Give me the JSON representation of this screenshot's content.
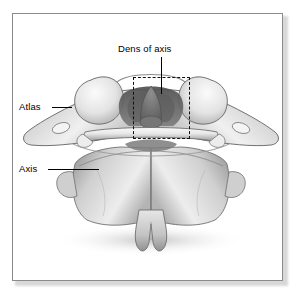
{
  "figure": {
    "view": "posterior-superior view of articulated C1 and C2",
    "style": "grayscale medical illustration",
    "frame": {
      "border_color": "#8b8b8b",
      "background": "#ffffff"
    }
  },
  "labels": [
    {
      "id": "dens",
      "text": "Dens of axis",
      "position": "top-center",
      "leader": "vertical line down to the dens tip"
    },
    {
      "id": "atlas",
      "text": "Atlas",
      "position": "left-upper",
      "leader": "short horizontal line to left transverse process"
    },
    {
      "id": "axis",
      "text": "Axis",
      "position": "left-lower",
      "leader": "long horizontal line to body of axis"
    }
  ],
  "annotations": [
    {
      "id": "highlight-box",
      "shape": "dashed-rectangle",
      "color": "#111111",
      "encloses": "dens of axis and anterior arch of atlas"
    }
  ],
  "palette": {
    "bone_light": "#f2f2f2",
    "bone_mid": "#c9c9c9",
    "bone_shadow": "#8f8f8f",
    "dens_dark": "#6f6f6f",
    "outline": "#5a5a5a",
    "label_text": "#000000"
  }
}
